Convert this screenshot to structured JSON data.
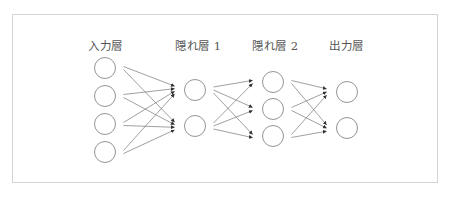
{
  "diagram": {
    "type": "neural-network",
    "colors": {
      "border": "#d4d4d4",
      "stroke": "#777777",
      "text": "#555555",
      "background": "#ffffff"
    },
    "layers": [
      {
        "label": "入力層",
        "node_count": 4
      },
      {
        "label": "隠れ層 1",
        "node_count": 2
      },
      {
        "label": "隠れ層 2",
        "node_count": 3
      },
      {
        "label": "出力層",
        "node_count": 2
      }
    ],
    "connections": "fully-connected, directed left-to-right"
  }
}
